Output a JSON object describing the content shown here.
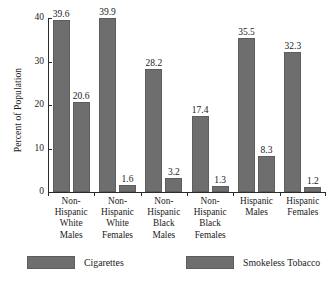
{
  "chart_data": {
    "type": "bar",
    "title": "",
    "subtitle": "",
    "xlabel": "",
    "ylabel": "Percent of Population",
    "ylim": [
      0,
      40
    ],
    "yticks": [
      0,
      10,
      20,
      30,
      40
    ],
    "ytick_labels": [
      "0",
      "10",
      "20",
      "30",
      "40"
    ],
    "grid": false,
    "legend_position": "bottom",
    "categories": [
      "Non-Hispanic White Males",
      "Non-Hispanic White Females",
      "Non-Hispanic Black Males",
      "Non-Hispanic Black Females",
      "Hispanic Males",
      "Hispanic Females"
    ],
    "category_lines": [
      [
        "Non-",
        "Hispanic",
        "White",
        "Males"
      ],
      [
        "Non-",
        "Hispanic",
        "White",
        "Females"
      ],
      [
        "Non-",
        "Hispanic",
        "Black",
        "Males"
      ],
      [
        "Non-",
        "Hispanic",
        "Black",
        "Females"
      ],
      [
        "Hispanic",
        "Males"
      ],
      [
        "Hispanic",
        "Females"
      ]
    ],
    "series": [
      {
        "name": "Cigarettes",
        "color": "#6e6e6e",
        "values": [
          39.6,
          39.9,
          28.2,
          17.4,
          35.5,
          32.3
        ],
        "value_labels": [
          "39.6",
          "39.9",
          "28.2",
          "17.4",
          "35.5",
          "32.3"
        ]
      },
      {
        "name": "Smokeless Tobacco",
        "color": "#6e6e6e",
        "values": [
          20.6,
          1.6,
          3.2,
          1.3,
          8.3,
          1.2
        ],
        "value_labels": [
          "20.6",
          "1.6",
          "3.2",
          "1.3",
          "8.3",
          "1.2"
        ]
      }
    ]
  },
  "legend": {
    "items": [
      {
        "label": "Cigarettes",
        "color": "#6e6e6e"
      },
      {
        "label": "Smokeless Tobacco",
        "color": "#6e6e6e"
      }
    ]
  },
  "colors": {
    "bar_fill": "#6e6e6e",
    "bar_border": "#5d5d5d",
    "axis": "#2b2b2b",
    "text": "#1a1a1a",
    "background": "#ffffff"
  }
}
